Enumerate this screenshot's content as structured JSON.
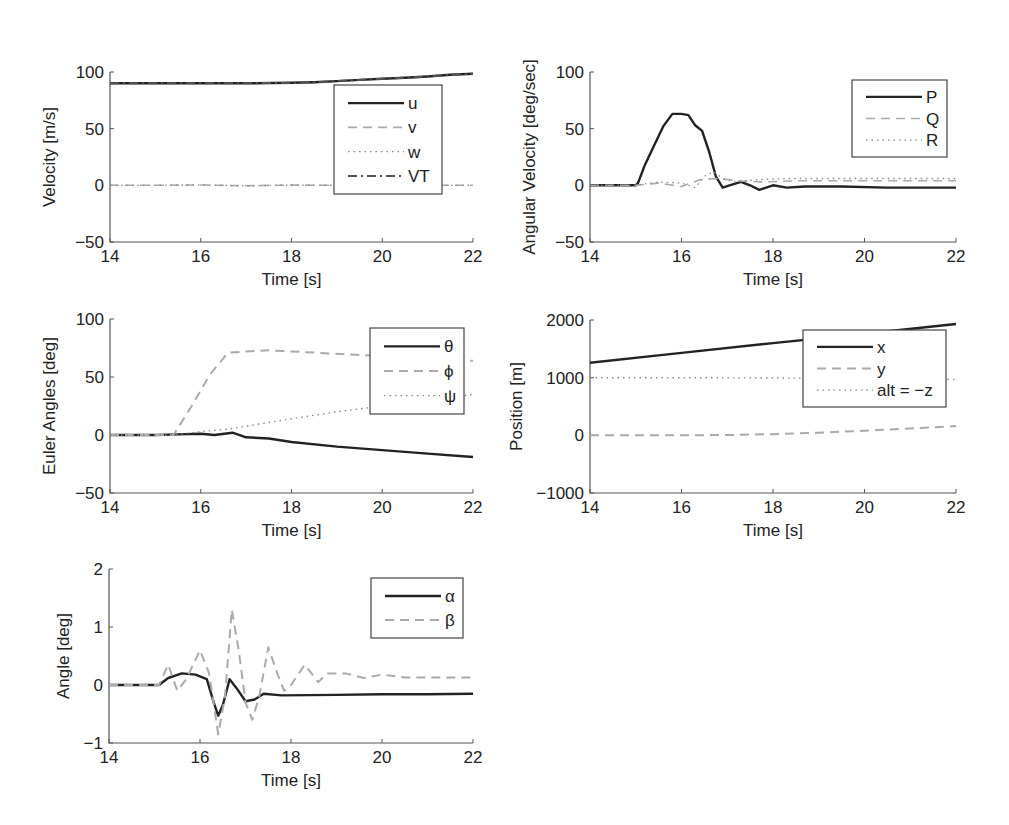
{
  "figure": {
    "panel_count": 5,
    "caption_visible": false
  },
  "chart_data": [
    {
      "id": "velocity",
      "type": "line",
      "title": "",
      "xlabel": "Time [s]",
      "ylabel": "Velocity [m/s]",
      "xlim": [
        14,
        22
      ],
      "ylim": [
        -50,
        100
      ],
      "xticks": [
        14,
        16,
        18,
        20,
        22
      ],
      "yticks": [
        -50,
        0,
        50,
        100
      ],
      "ytick_labels": [
        "−50",
        "0",
        "50",
        "100"
      ],
      "grid": false,
      "legend_position": "upper right (inset)",
      "box": {
        "left": 110,
        "top": 72,
        "right": 473,
        "bottom": 242
      },
      "legend": {
        "left": 334,
        "top": 85,
        "width": 108,
        "height": 109
      },
      "series": [
        {
          "name": "u",
          "style": "solid",
          "color": "#222222",
          "width": 2.4,
          "x": [
            14,
            15,
            16,
            17,
            18,
            18.5,
            19,
            19.5,
            20,
            20.5,
            21,
            21.5,
            22
          ],
          "y": [
            90,
            90,
            90,
            90,
            90.5,
            91,
            92,
            93,
            94,
            95,
            96,
            97.5,
            98.5
          ]
        },
        {
          "name": "v",
          "style": "dashed",
          "color": "#aaaaaa",
          "width": 1.6,
          "x": [
            14,
            15,
            16,
            17,
            18,
            19,
            20,
            21,
            22
          ],
          "y": [
            0,
            0,
            0.3,
            -0.3,
            0.2,
            0,
            0,
            0,
            0
          ]
        },
        {
          "name": "w",
          "style": "dotted",
          "color": "#888888",
          "width": 1.3,
          "x": [
            14,
            15,
            16,
            17,
            18,
            19,
            20,
            21,
            22
          ],
          "y": [
            0,
            0,
            0.5,
            -0.5,
            0.3,
            0,
            0,
            0,
            0
          ]
        },
        {
          "name": "VT",
          "style": "dashdot",
          "color": "#555555",
          "width": 2.0,
          "x": [
            14,
            15,
            16,
            17,
            18,
            18.5,
            19,
            19.5,
            20,
            20.5,
            21,
            21.5,
            22
          ],
          "y": [
            90,
            90,
            90,
            90,
            90.5,
            91,
            92,
            93,
            94,
            95,
            96,
            97.5,
            98.5
          ]
        }
      ]
    },
    {
      "id": "angular_velocity",
      "type": "line",
      "title": "",
      "xlabel": "Time [s]",
      "ylabel": "Angular Velocity [deg/sec]",
      "xlim": [
        14,
        22
      ],
      "ylim": [
        -50,
        100
      ],
      "xticks": [
        14,
        16,
        18,
        20,
        22
      ],
      "yticks": [
        -50,
        0,
        50,
        100
      ],
      "ytick_labels": [
        "−50",
        "0",
        "50",
        "100"
      ],
      "grid": false,
      "legend_position": "upper right (inset)",
      "box": {
        "left": 590,
        "top": 72,
        "right": 956,
        "bottom": 242
      },
      "legend": {
        "left": 852,
        "top": 80,
        "width": 95,
        "height": 77
      },
      "series": [
        {
          "name": "P",
          "style": "solid",
          "color": "#222222",
          "width": 2.4,
          "x": [
            14,
            15,
            15.05,
            15.2,
            15.4,
            15.6,
            15.8,
            16.0,
            16.15,
            16.3,
            16.45,
            16.6,
            16.75,
            16.9,
            17.05,
            17.3,
            17.5,
            17.7,
            18.0,
            18.3,
            18.7,
            19.5,
            20.5,
            22
          ],
          "y": [
            0,
            0,
            2,
            18,
            35,
            52,
            63,
            63,
            62,
            53,
            48,
            30,
            8,
            -2,
            0,
            3,
            0,
            -4,
            0,
            -2,
            -1,
            -1,
            -2,
            -2
          ]
        },
        {
          "name": "Q",
          "style": "dashed",
          "color": "#aaaaaa",
          "width": 1.6,
          "x": [
            14,
            15,
            15.5,
            16,
            16.4,
            16.8,
            17.2,
            17.8,
            18.5,
            19.5,
            20.5,
            22
          ],
          "y": [
            0,
            0,
            2,
            -1,
            5,
            6,
            4,
            3,
            4,
            4,
            4,
            4
          ]
        },
        {
          "name": "R",
          "style": "dotted",
          "color": "#888888",
          "width": 1.3,
          "x": [
            14,
            15,
            15.5,
            16,
            16.3,
            16.5,
            16.7,
            16.9,
            17.2,
            17.6,
            18.3,
            19.2,
            20.5,
            22
          ],
          "y": [
            0,
            0,
            3,
            2,
            -2,
            8,
            12,
            6,
            3,
            5,
            6,
            6,
            6,
            6
          ]
        }
      ]
    },
    {
      "id": "euler_angles",
      "type": "line",
      "title": "",
      "xlabel": "Time [s]",
      "ylabel": "Euler Angles [deg]",
      "xlim": [
        14,
        22
      ],
      "ylim": [
        -50,
        100
      ],
      "xticks": [
        14,
        16,
        18,
        20,
        22
      ],
      "yticks": [
        -50,
        0,
        50,
        100
      ],
      "ytick_labels": [
        "−50",
        "0",
        "50",
        "100"
      ],
      "grid": false,
      "legend_position": "upper right (inset)",
      "box": {
        "left": 110,
        "top": 319,
        "right": 473,
        "bottom": 493
      },
      "legend": {
        "left": 370,
        "top": 328,
        "width": 94,
        "height": 86
      },
      "series": [
        {
          "name": "θ",
          "style": "solid",
          "color": "#222222",
          "width": 2.4,
          "x": [
            14,
            15,
            15.5,
            16,
            16.3,
            16.7,
            17.0,
            17.5,
            18,
            19,
            20,
            21,
            22
          ],
          "y": [
            0,
            0,
            0.5,
            1,
            0,
            2,
            -2,
            -3,
            -6,
            -10,
            -13,
            -16,
            -19
          ]
        },
        {
          "name": "ϕ",
          "style": "dashed",
          "color": "#aaaaaa",
          "width": 2.0,
          "x": [
            14,
            15.4,
            15.8,
            16.2,
            16.6,
            17.0,
            17.5,
            18.5,
            19.5,
            20.5,
            21.5,
            22
          ],
          "y": [
            0,
            0,
            25,
            52,
            71,
            72,
            73,
            71,
            69,
            67,
            65,
            64
          ]
        },
        {
          "name": "ψ",
          "style": "dotted",
          "color": "#888888",
          "width": 1.4,
          "x": [
            14,
            15.4,
            16,
            16.6,
            17.2,
            18,
            19,
            20,
            21,
            22
          ],
          "y": [
            0,
            0,
            3,
            5,
            9,
            14,
            20,
            25,
            30,
            35
          ]
        }
      ]
    },
    {
      "id": "position",
      "type": "line",
      "title": "",
      "xlabel": "Time [s]",
      "ylabel": "Position [m]",
      "xlim": [
        14,
        22
      ],
      "ylim": [
        -1000,
        2000
      ],
      "xticks": [
        14,
        16,
        18,
        20,
        22
      ],
      "yticks": [
        -1000,
        0,
        1000,
        2000
      ],
      "ytick_labels": [
        "−1000",
        "0",
        "1000",
        "2000"
      ],
      "grid": false,
      "legend_position": "upper right (inset)",
      "box": {
        "left": 590,
        "top": 320,
        "right": 956,
        "bottom": 493
      },
      "legend": {
        "left": 803,
        "top": 330,
        "width": 143,
        "height": 77
      },
      "series": [
        {
          "name": "x",
          "style": "solid",
          "color": "#222222",
          "width": 2.4,
          "x": [
            14,
            16,
            18,
            20,
            22
          ],
          "y": [
            1260,
            1430,
            1600,
            1760,
            1930
          ]
        },
        {
          "name": "y",
          "style": "dashed",
          "color": "#aaaaaa",
          "width": 2.0,
          "x": [
            14,
            16,
            17,
            18,
            19,
            20,
            21,
            22
          ],
          "y": [
            0,
            0,
            5,
            20,
            45,
            80,
            120,
            160
          ]
        },
        {
          "name": "alt = −z",
          "style": "dotted",
          "color": "#888888",
          "width": 1.4,
          "x": [
            14,
            16,
            18,
            20,
            22
          ],
          "y": [
            1000,
            1000,
            995,
            985,
            970
          ]
        }
      ]
    },
    {
      "id": "aero_angles",
      "type": "line",
      "title": "",
      "xlabel": "Time [s]",
      "ylabel": "Angle [deg]",
      "xlim": [
        14,
        22
      ],
      "ylim": [
        -1,
        2
      ],
      "xticks": [
        14,
        16,
        18,
        20,
        22
      ],
      "yticks": [
        -1,
        0,
        1,
        2
      ],
      "ytick_labels": [
        "−1",
        "0",
        "1",
        "2"
      ],
      "grid": false,
      "legend_position": "upper right (inset)",
      "box": {
        "left": 109,
        "top": 569,
        "right": 473,
        "bottom": 743
      },
      "legend": {
        "left": 371,
        "top": 578,
        "width": 92,
        "height": 60
      },
      "series": [
        {
          "name": "α",
          "style": "solid",
          "color": "#222222",
          "width": 2.4,
          "x": [
            14,
            15.1,
            15.3,
            15.6,
            15.9,
            16.15,
            16.3,
            16.4,
            16.5,
            16.65,
            16.8,
            17.0,
            17.2,
            17.4,
            17.8,
            19,
            20,
            21,
            22
          ],
          "y": [
            0,
            0,
            0.12,
            0.2,
            0.18,
            0.1,
            -0.3,
            -0.53,
            -0.35,
            0.1,
            -0.05,
            -0.28,
            -0.25,
            -0.15,
            -0.18,
            -0.17,
            -0.16,
            -0.16,
            -0.15
          ]
        },
        {
          "name": "β",
          "style": "dashed",
          "color": "#aaaaaa",
          "width": 2.0,
          "x": [
            14,
            15.1,
            15.3,
            15.5,
            15.7,
            16.0,
            16.2,
            16.4,
            16.55,
            16.7,
            16.85,
            17.0,
            17.15,
            17.3,
            17.5,
            17.7,
            17.85,
            18.0,
            18.3,
            18.6,
            18.8,
            19.2,
            19.6,
            20.0,
            20.5,
            21,
            22
          ],
          "y": [
            0,
            0,
            0.35,
            -0.1,
            0.1,
            0.6,
            0.2,
            -0.85,
            -0.2,
            1.3,
            0.6,
            -0.3,
            -0.6,
            -0.2,
            0.65,
            0.2,
            -0.1,
            0.0,
            0.35,
            0.05,
            0.2,
            0.2,
            0.12,
            0.18,
            0.13,
            0.13,
            0.13
          ]
        }
      ]
    }
  ]
}
